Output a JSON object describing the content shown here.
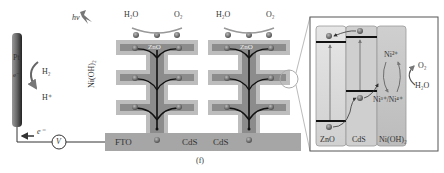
{
  "figure": {
    "caption": "(f)",
    "light_label": "hv",
    "colors": {
      "shell_cds": "#bdbdbd",
      "core_zno": "#8c8c8c",
      "fto": "#a6a6a6",
      "electron": "#6e6e6e",
      "pt_electrode": "#555555"
    }
  },
  "counter_electrode": {
    "label": "Pt",
    "electron_label": "e⁻",
    "reaction_top": "H₂",
    "reaction_bottom": "H⁺"
  },
  "circuit": {
    "electron_flow_label": "e⁻",
    "meter_label": "V"
  },
  "nanostructure": {
    "side_label": "Ni(OH)₂",
    "substrate_label": "FTO",
    "core_label": "ZnO",
    "shell_labels": [
      "CdS",
      "CdS"
    ],
    "rod_left": {
      "reactant": "H₂O",
      "product": "O₂"
    },
    "rod_right": {
      "reactant": "H₂O",
      "product": "O₂"
    }
  },
  "band_diagram": {
    "columns": [
      "ZnO",
      "CdS",
      "Ni(OH)₂"
    ],
    "ni_states": {
      "top": "Ni²⁺",
      "bottom": "Ni³⁺/Ni⁴⁺"
    },
    "oxidation": {
      "product": "O₂",
      "reactant": "H₂O"
    }
  }
}
